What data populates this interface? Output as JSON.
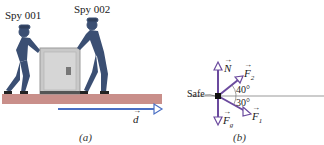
{
  "panel_a": {
    "caption": "(a)",
    "labels": {
      "spy1": "Spy 001",
      "spy2": "Spy 002"
    },
    "displacement_label": "d",
    "colors": {
      "floor": "#c98f8a",
      "arrow": "#4a6fc4",
      "safe": "#c7c7c7",
      "spy": "#3b4f73"
    }
  },
  "panel_b": {
    "caption": "(b)",
    "safe_label": "Safe",
    "vectors": [
      {
        "name": "N",
        "sub": "",
        "direction": "up"
      },
      {
        "name": "F",
        "sub": "2",
        "angle": "40°",
        "direction": "up-right"
      },
      {
        "name": "F",
        "sub": "1",
        "angle": "30°",
        "direction": "down-right"
      },
      {
        "name": "F",
        "sub": "g",
        "direction": "down"
      }
    ],
    "angles": {
      "f2": "40°",
      "f1": "30°"
    },
    "colors": {
      "vector": "#6b4a9e",
      "axis": "#999999",
      "dot": "#111111"
    }
  }
}
